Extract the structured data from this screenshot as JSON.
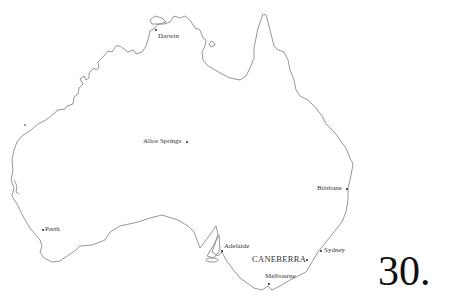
{
  "map": {
    "title": "Australia",
    "cities": {
      "darwin": "Darwin",
      "alice_springs": "Alice Springs",
      "brisbane": "Brisbane",
      "perth": "Perth",
      "adelaide": "Adelaide",
      "canberra": "CANEBERRA",
      "sydney": "Sydney",
      "melbourne": "Melbourne"
    },
    "stroke_color": "#8a8a8a"
  },
  "page_number": "30."
}
